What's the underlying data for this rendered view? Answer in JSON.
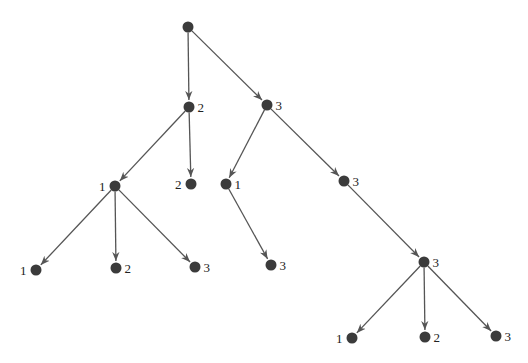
{
  "diagram": {
    "type": "tree",
    "colors": {
      "node": "#3b3b3b",
      "edge": "#555555",
      "label": "#222222"
    },
    "nodes": [
      {
        "id": "n0",
        "x": 188,
        "y": 27,
        "label": "",
        "label_side": "none"
      },
      {
        "id": "n1",
        "x": 189,
        "y": 107,
        "label": "2",
        "label_side": "right"
      },
      {
        "id": "n2",
        "x": 267,
        "y": 105,
        "label": "3",
        "label_side": "right"
      },
      {
        "id": "n3",
        "x": 115,
        "y": 186,
        "label": "1",
        "label_side": "left"
      },
      {
        "id": "n4",
        "x": 191,
        "y": 184,
        "label": "2",
        "label_side": "left"
      },
      {
        "id": "n5",
        "x": 226,
        "y": 184,
        "label": "1",
        "label_side": "right"
      },
      {
        "id": "n6",
        "x": 344,
        "y": 181,
        "label": "3",
        "label_side": "right"
      },
      {
        "id": "n7",
        "x": 36,
        "y": 270,
        "label": "1",
        "label_side": "left"
      },
      {
        "id": "n8",
        "x": 116,
        "y": 268,
        "label": "2",
        "label_side": "right"
      },
      {
        "id": "n9",
        "x": 195,
        "y": 267,
        "label": "3",
        "label_side": "right"
      },
      {
        "id": "n10",
        "x": 271,
        "y": 265,
        "label": "3",
        "label_side": "right"
      },
      {
        "id": "n11",
        "x": 424,
        "y": 262,
        "label": "3",
        "label_side": "right"
      },
      {
        "id": "n12",
        "x": 352,
        "y": 338,
        "label": "1",
        "label_side": "left"
      },
      {
        "id": "n13",
        "x": 425,
        "y": 337,
        "label": "2",
        "label_side": "right"
      },
      {
        "id": "n14",
        "x": 496,
        "y": 336,
        "label": "3",
        "label_side": "right"
      }
    ],
    "edges": [
      {
        "from": "n0",
        "to": "n1"
      },
      {
        "from": "n0",
        "to": "n2"
      },
      {
        "from": "n1",
        "to": "n3"
      },
      {
        "from": "n1",
        "to": "n4"
      },
      {
        "from": "n2",
        "to": "n5"
      },
      {
        "from": "n2",
        "to": "n6"
      },
      {
        "from": "n3",
        "to": "n7"
      },
      {
        "from": "n3",
        "to": "n8"
      },
      {
        "from": "n3",
        "to": "n9"
      },
      {
        "from": "n5",
        "to": "n10"
      },
      {
        "from": "n6",
        "to": "n11"
      },
      {
        "from": "n11",
        "to": "n12"
      },
      {
        "from": "n11",
        "to": "n13"
      },
      {
        "from": "n11",
        "to": "n14"
      }
    ]
  }
}
